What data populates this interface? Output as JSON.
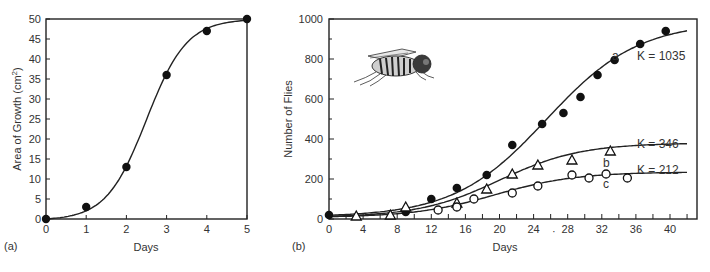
{
  "chart_data": [
    {
      "id": "a",
      "type": "line",
      "panel_label": "(a)",
      "title": "",
      "xlabel": "Days",
      "ylabel": "Area of Growth (cm²)",
      "ylabel_parts": {
        "main": "Area of Growth (cm",
        "sup": "2",
        "close": ")"
      },
      "xlim": [
        0,
        5
      ],
      "ylim": [
        0,
        50
      ],
      "xticks": [
        0,
        1,
        2,
        3,
        4,
        5
      ],
      "yticks": [
        0,
        5,
        10,
        15,
        20,
        25,
        30,
        35,
        40,
        45,
        50
      ],
      "grid": false,
      "legend": null,
      "series": [
        {
          "name": "growth",
          "marker": "filled-circle",
          "x": [
            0,
            1,
            2,
            3,
            4,
            5
          ],
          "y": [
            0,
            3,
            13,
            36,
            47,
            50
          ],
          "fit": "logistic"
        }
      ]
    },
    {
      "id": "b",
      "type": "scatter",
      "panel_label": "(b)",
      "title": "",
      "xlabel": "Days",
      "ylabel": "Number of Flies",
      "xlim": [
        0,
        42
      ],
      "ylim": [
        0,
        1000
      ],
      "xticks": [
        0,
        4,
        8,
        12,
        16,
        20,
        24,
        28,
        32,
        36,
        40
      ],
      "yticks": [
        0,
        200,
        400,
        600,
        800,
        1000
      ],
      "grid": false,
      "legend": null,
      "series": [
        {
          "name": "a",
          "marker": "filled-circle",
          "K": 1035,
          "annotation": "K = 1035",
          "x": [
            0,
            9,
            12,
            15,
            18.5,
            21.5,
            25,
            27.5,
            29.5,
            31.5,
            33.5,
            36.5,
            39.5
          ],
          "y": [
            20,
            35,
            100,
            155,
            220,
            370,
            475,
            530,
            610,
            720,
            795,
            875,
            940
          ],
          "fit": "logistic"
        },
        {
          "name": "b",
          "marker": "open-triangle",
          "K": 346,
          "annotation": "K = 346",
          "x": [
            3.2,
            7.2,
            9,
            15,
            18.5,
            21.5,
            24.5,
            28.5,
            33
          ],
          "y": [
            15,
            20,
            60,
            80,
            150,
            225,
            270,
            295,
            340
          ],
          "fit": "logistic"
        },
        {
          "name": "c",
          "marker": "open-circle",
          "K": 212,
          "annotation": "K = 212",
          "x": [
            12.8,
            15,
            17,
            21.5,
            24.5,
            28.5,
            30.5,
            32.5,
            35
          ],
          "y": [
            45,
            60,
            100,
            130,
            165,
            220,
            205,
            225,
            205
          ],
          "fit": "logistic"
        }
      ],
      "illustration": "housefly-drawing"
    }
  ],
  "labels": {
    "curve_a": "a",
    "curve_b": "b",
    "curve_c": "c",
    "k_a": "K = 1035",
    "k_b": "K = 346",
    "k_c": "K = 212"
  }
}
